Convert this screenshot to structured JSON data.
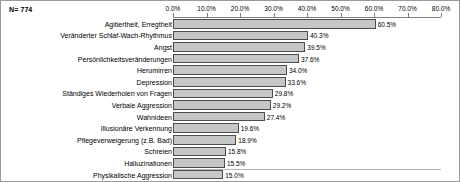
{
  "header": {
    "sample_size_label": "N= 774"
  },
  "chart_data": {
    "type": "bar",
    "orientation": "horizontal",
    "title": "",
    "subtitle": "",
    "xlabel": "",
    "ylabel": "",
    "xlim": [
      0,
      80
    ],
    "xtick_labels": [
      "0.0%",
      "10.0%",
      "20.0%",
      "30.0%",
      "40.0%",
      "50.0%",
      "60.0%",
      "70.0%",
      "80.0%"
    ],
    "xtick_values": [
      0,
      10,
      20,
      30,
      40,
      50,
      60,
      70,
      80
    ],
    "grid": false,
    "legend": "none",
    "bar_color": "#c6c6c6",
    "bar_border_color": "#4d4d4d",
    "categories": [
      "Agitiertheit, Erregtheit",
      "Veränderter Schlaf-Wach-Rhythmus",
      "Angst",
      "Persönlichkeitsveränderungen",
      "Herumirren",
      "Depression",
      "Ständiges Wiederholen von Fragen",
      "Verbale Aggression",
      "Wahnideen",
      "Illusionäre Verkennung",
      "Pflegeverweigerung (z.B. Bad)",
      "Schreien",
      "Halluzinationen",
      "Physikalische Aggression"
    ],
    "values": [
      60.5,
      40.3,
      39.5,
      37.6,
      34.0,
      33.6,
      29.8,
      29.2,
      27.4,
      19.6,
      18.9,
      15.8,
      15.5,
      15.0
    ],
    "value_labels": [
      "60.5%",
      "40.3%",
      "39.5%",
      "37.6%",
      "34.0%",
      "33.6%",
      "29.8%",
      "29.2%",
      "27.4%",
      "19.6%",
      "18.9%",
      "15.8%",
      "15.5%",
      "15.0%"
    ]
  }
}
